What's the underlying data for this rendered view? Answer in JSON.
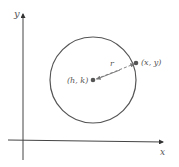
{
  "diagram": {
    "axes": {
      "x_label": "x",
      "y_label": "y"
    },
    "circle": {
      "color": "#555555"
    },
    "center": {
      "label": "(h, k)",
      "color": "#555555"
    },
    "point": {
      "label": "(x, y)",
      "color": "#555555"
    },
    "radius": {
      "label": "r"
    }
  }
}
